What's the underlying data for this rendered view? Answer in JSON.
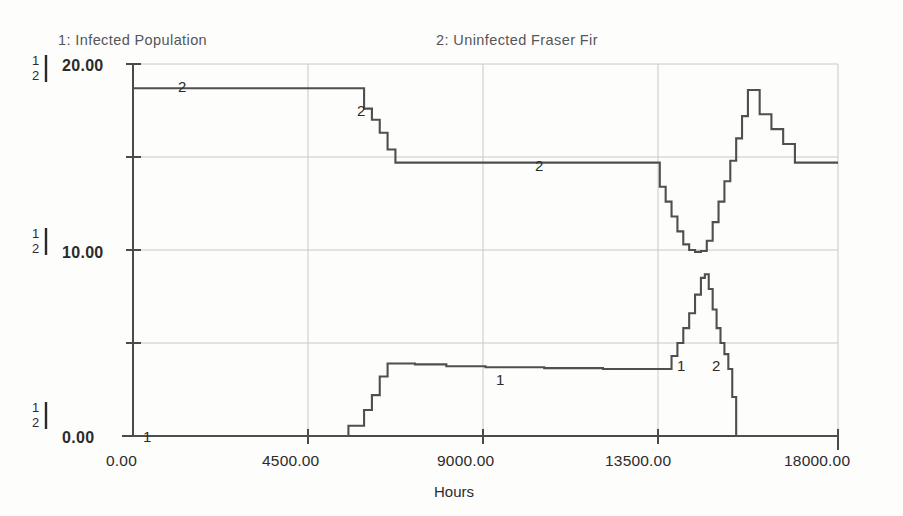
{
  "legend": {
    "series1": "1: Infected  Population",
    "series2": "2: Uninfected  Fraser Fir"
  },
  "axes": {
    "y_ticks": [
      "20.00",
      "10.00",
      "0.00"
    ],
    "x_ticks": [
      "0.00",
      "4500.00",
      "9000.00",
      "13500.00",
      "18000.00"
    ],
    "x_title": "Hours"
  },
  "series_keys": {
    "k1": "1",
    "k2": "2"
  },
  "inline_markers": {
    "m1": "2",
    "m2": "2",
    "m3": "2",
    "m4": "1",
    "m5": "1",
    "m6": "1",
    "m7": "2"
  },
  "chart_data": {
    "type": "line",
    "title": "",
    "subtitle": "",
    "xlabel": "Hours",
    "ylabel": "",
    "xlim": [
      0,
      18000
    ],
    "ylim": [
      0,
      20
    ],
    "grid": true,
    "legend_position": "top",
    "x_ticks": [
      0,
      4500,
      9000,
      13500,
      18000
    ],
    "y_ticks": [
      0,
      10,
      20
    ],
    "y_gridlines": [
      0,
      5,
      10,
      15,
      20
    ],
    "series": [
      {
        "name": "1: Infected  Population",
        "key": "1",
        "color": "#4f4f4f",
        "step": true,
        "x": [
          0,
          5300,
          5500,
          5700,
          5900,
          6100,
          6300,
          6500,
          7200,
          8000,
          9000,
          10500,
          12000,
          13200,
          13600,
          13750,
          13900,
          14050,
          14200,
          14350,
          14500,
          14600,
          14700,
          14800,
          14900,
          15000,
          15100,
          15200,
          15300,
          15400,
          18000
        ],
        "y": [
          0,
          0,
          0.55,
          0.55,
          1.4,
          2.2,
          3.2,
          3.9,
          3.85,
          3.75,
          3.7,
          3.65,
          3.6,
          3.6,
          3.6,
          4.3,
          5.0,
          5.8,
          6.6,
          7.6,
          8.5,
          8.7,
          7.9,
          6.8,
          5.8,
          5.0,
          4.4,
          3.6,
          2.1,
          0.0,
          0.0
        ]
      },
      {
        "name": "2: Uninfected  Fraser Fir",
        "key": "2",
        "color": "#4f4f4f",
        "step": true,
        "x": [
          0,
          5700,
          5900,
          6100,
          6300,
          6500,
          6700,
          8000,
          10000,
          12000,
          13300,
          13450,
          13600,
          13750,
          13900,
          14050,
          14200,
          14350,
          14500,
          14650,
          14800,
          14950,
          15100,
          15250,
          15400,
          15550,
          15700,
          15850,
          16000,
          16300,
          16600,
          16900,
          17200,
          18000
        ],
        "y": [
          18.7,
          18.7,
          17.6,
          17.0,
          16.3,
          15.4,
          14.7,
          14.7,
          14.7,
          14.7,
          14.7,
          13.4,
          12.6,
          11.8,
          11.0,
          10.3,
          10.0,
          9.9,
          9.95,
          10.5,
          11.5,
          12.6,
          13.7,
          14.8,
          16.0,
          17.2,
          18.6,
          18.6,
          17.3,
          16.5,
          15.7,
          14.7,
          14.7,
          14.7
        ]
      }
    ],
    "annotations": [
      {
        "text": "2",
        "x": 1900,
        "y": 18.7
      },
      {
        "text": "2",
        "x": 6150,
        "y": 17.6
      },
      {
        "text": "2",
        "x": 9000,
        "y": 14.7
      },
      {
        "text": "1",
        "x": 9100,
        "y": 3.7
      },
      {
        "text": "1",
        "x": 13800,
        "y": 3.0
      },
      {
        "text": "2",
        "x": 14900,
        "y": 3.0
      },
      {
        "text": "1",
        "x": 150,
        "y": 0.0
      }
    ]
  }
}
